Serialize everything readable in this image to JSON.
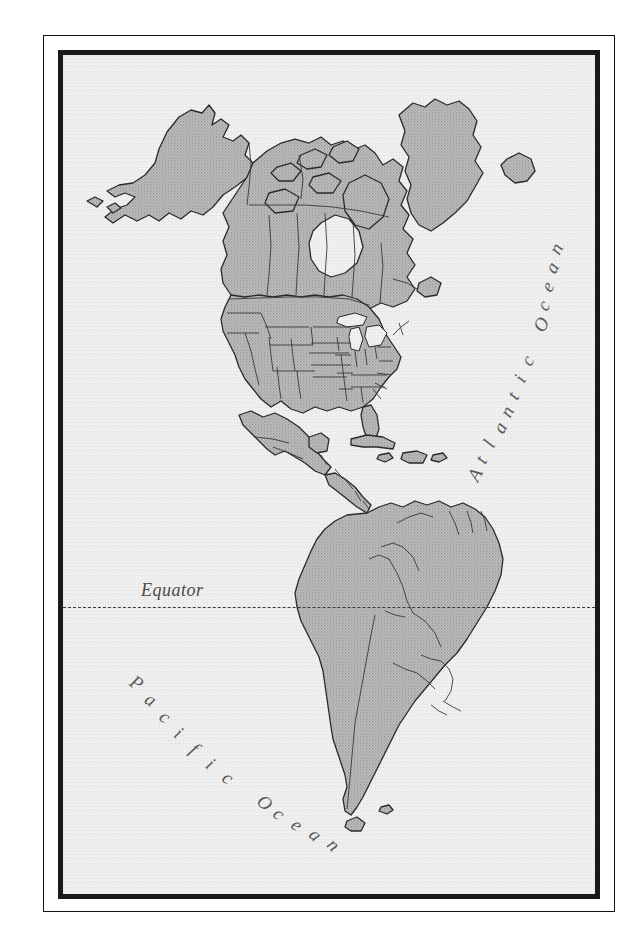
{
  "map": {
    "title": "Map of the Americas",
    "labels": {
      "atlantic_ocean": "Atlantic Ocean",
      "pacific_ocean": "Pacific Ocean",
      "equator": "Equator"
    },
    "colors": {
      "land_fill": "#b9b9b9",
      "ocean_fill": "#f0f0f0",
      "coastline": "#2b2b2b",
      "border_line": "#3a3a3a",
      "frame_dark": "#1a1a1a",
      "label_text": "#5a5a5a",
      "equator_line": "#3a3a3a",
      "page_background": "#ffffff"
    },
    "features": {
      "equator_style": "dashed",
      "frame_style": "double-rule",
      "land_shading": "halftone-gray",
      "projection_hint": "north-south americas"
    },
    "landmasses": [
      "Alaska",
      "Canada",
      "Greenland",
      "Iceland",
      "United States",
      "Mexico",
      "Central America",
      "Cuba",
      "Hispaniola",
      "Colombia",
      "Venezuela",
      "Guyana",
      "Suriname",
      "French Guiana",
      "Ecuador",
      "Peru",
      "Brazil",
      "Bolivia",
      "Paraguay",
      "Chile",
      "Argentina",
      "Uruguay"
    ],
    "water_bodies": [
      "Atlantic Ocean",
      "Pacific Ocean",
      "Gulf of Mexico",
      "Hudson Bay",
      "Great Lakes",
      "Caribbean Sea"
    ]
  }
}
